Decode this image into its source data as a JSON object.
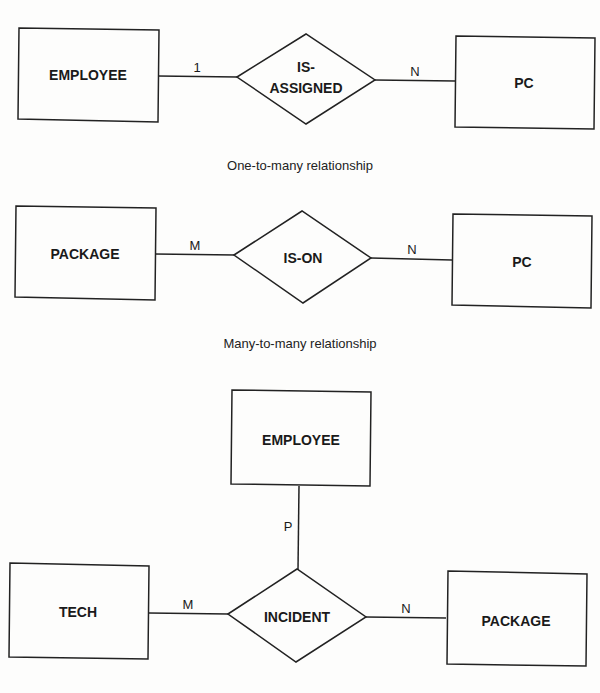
{
  "diagrams": [
    {
      "entities": [
        {
          "label": "EMPLOYEE"
        },
        {
          "label": "PC"
        }
      ],
      "relationship": {
        "label_line1": "IS-",
        "label_line2": "ASSIGNED"
      },
      "cardinalities": [
        "1",
        "N"
      ],
      "caption": "One-to-many relationship"
    },
    {
      "entities": [
        {
          "label": "PACKAGE"
        },
        {
          "label": "PC"
        }
      ],
      "relationship": {
        "label": "IS-ON"
      },
      "cardinalities": [
        "M",
        "N"
      ],
      "caption": "Many-to-many relationship"
    },
    {
      "entities": [
        {
          "label": "EMPLOYEE"
        },
        {
          "label": "TECH"
        },
        {
          "label": "PACKAGE"
        }
      ],
      "relationship": {
        "label": "INCIDENT"
      },
      "cardinalities": [
        "P",
        "M",
        "N"
      ]
    }
  ]
}
